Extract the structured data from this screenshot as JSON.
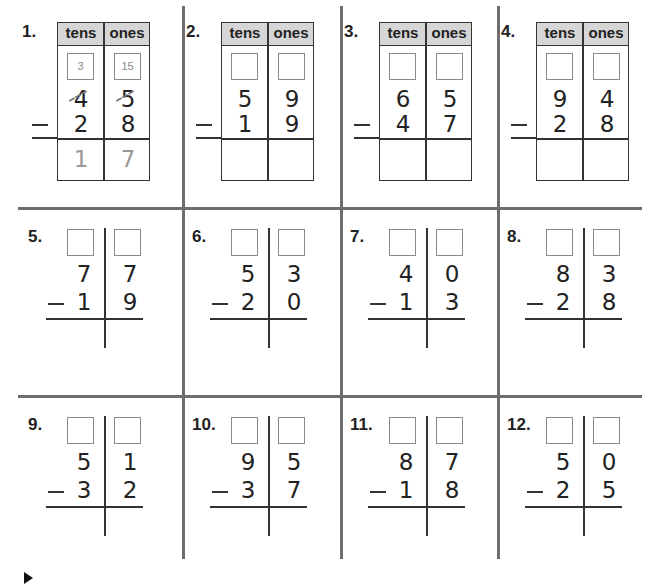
{
  "worksheet": {
    "header_labels": {
      "tens": "tens",
      "ones": "ones"
    },
    "minus_sign": "−",
    "problems": [
      {
        "label": "1.",
        "layout": "table",
        "regroup_tens": "3",
        "regroup_ones": "15",
        "top_tens": "4",
        "top_ones": "5",
        "bottom_tens": "2",
        "bottom_ones": "8",
        "answer_tens": "1",
        "answer_ones": "7",
        "crossed_out": true
      },
      {
        "label": "2.",
        "layout": "table",
        "regroup_tens": "",
        "regroup_ones": "",
        "top_tens": "5",
        "top_ones": "9",
        "bottom_tens": "1",
        "bottom_ones": "9",
        "answer_tens": "",
        "answer_ones": ""
      },
      {
        "label": "3.",
        "layout": "table",
        "regroup_tens": "",
        "regroup_ones": "",
        "top_tens": "6",
        "top_ones": "5",
        "bottom_tens": "4",
        "bottom_ones": "7",
        "answer_tens": "",
        "answer_ones": ""
      },
      {
        "label": "4.",
        "layout": "table",
        "regroup_tens": "",
        "regroup_ones": "",
        "top_tens": "9",
        "top_ones": "4",
        "bottom_tens": "2",
        "bottom_ones": "8",
        "answer_tens": "",
        "answer_ones": ""
      },
      {
        "label": "5.",
        "layout": "open",
        "top_tens": "7",
        "top_ones": "7",
        "bottom_tens": "1",
        "bottom_ones": "9"
      },
      {
        "label": "6.",
        "layout": "open",
        "top_tens": "5",
        "top_ones": "3",
        "bottom_tens": "2",
        "bottom_ones": "0"
      },
      {
        "label": "7.",
        "layout": "open",
        "top_tens": "4",
        "top_ones": "0",
        "bottom_tens": "1",
        "bottom_ones": "3"
      },
      {
        "label": "8.",
        "layout": "open",
        "top_tens": "8",
        "top_ones": "3",
        "bottom_tens": "2",
        "bottom_ones": "8"
      },
      {
        "label": "9.",
        "layout": "open",
        "top_tens": "5",
        "top_ones": "1",
        "bottom_tens": "3",
        "bottom_ones": "2"
      },
      {
        "label": "10.",
        "layout": "open",
        "top_tens": "9",
        "top_ones": "5",
        "bottom_tens": "3",
        "bottom_ones": "7"
      },
      {
        "label": "11.",
        "layout": "open",
        "top_tens": "8",
        "top_ones": "7",
        "bottom_tens": "1",
        "bottom_ones": "8"
      },
      {
        "label": "12.",
        "layout": "open",
        "top_tens": "5",
        "top_ones": "0",
        "bottom_tens": "2",
        "bottom_ones": "5"
      }
    ]
  },
  "colors": {
    "grid": "#6e6e6e",
    "header_bg": "#d6d6d6",
    "ink": "#222222",
    "traced": "#999999"
  }
}
